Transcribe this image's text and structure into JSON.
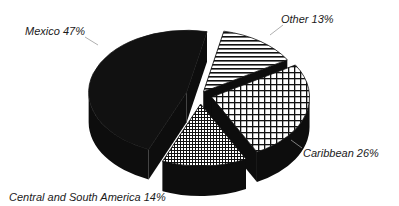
{
  "chart_data": {
    "type": "pie",
    "style": "3d-exploded",
    "title": "",
    "categories": [
      "Mexico",
      "Other",
      "Caribbean",
      "Central and South America"
    ],
    "values": [
      47,
      13,
      26,
      14
    ],
    "unit": "%",
    "labels": [
      "Mexico 47%",
      "Other 13%",
      "Caribbean 26%",
      "Central and South America 14%"
    ],
    "fills": [
      "solid-black",
      "horizontal-stripes",
      "coarse-grid",
      "fine-grid"
    ],
    "legend": "none (direct labels with leader lines)"
  },
  "colors": {
    "ink": "#111111",
    "side": "#0d0d0d",
    "background": "#ffffff",
    "leader": "#9a9a9a"
  },
  "labels": {
    "mexico": "Mexico 47%",
    "other": "Other 13%",
    "caribbean": "Caribbean 26%",
    "csa": "Central and South America 14%"
  }
}
